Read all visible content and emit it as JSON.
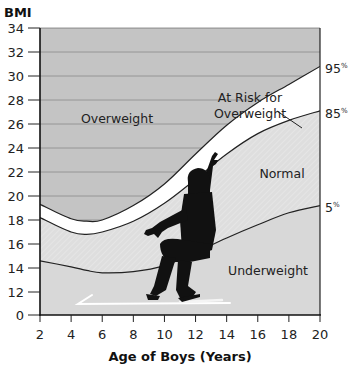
{
  "chart_data": {
    "type": "line",
    "title": "",
    "xlabel": "Age of Boys (Years)",
    "ylabel": "BMI",
    "xlim": [
      2,
      20
    ],
    "ylim": [
      0,
      34
    ],
    "y_axis_break": "axis jumps from 0 to 12",
    "x_ticks": [
      "2",
      "4",
      "6",
      "8",
      "10",
      "12",
      "14",
      "16",
      "18",
      "20"
    ],
    "y_ticks": [
      "0",
      "12",
      "14",
      "16",
      "18",
      "20",
      "22",
      "24",
      "26",
      "28",
      "30",
      "32",
      "34"
    ],
    "grid": "horizontal lines in overweight region",
    "x": [
      2,
      4,
      5,
      6,
      8,
      10,
      12,
      14,
      16,
      18,
      20
    ],
    "series": [
      {
        "name": "95%",
        "values": [
          19.3,
          18.1,
          17.9,
          18.0,
          19.2,
          21.0,
          23.5,
          25.9,
          27.8,
          29.3,
          30.8
        ]
      },
      {
        "name": "85%",
        "values": [
          18.2,
          17.0,
          16.8,
          17.0,
          17.9,
          19.4,
          21.4,
          23.5,
          25.2,
          26.3,
          27.1
        ]
      },
      {
        "name": "5%",
        "values": [
          14.6,
          14.1,
          13.8,
          13.6,
          13.7,
          14.2,
          15.3,
          16.5,
          17.6,
          18.6,
          19.2
        ]
      }
    ],
    "regions": [
      "Overweight",
      "At Risk for Overweight",
      "Normal",
      "Underweight"
    ],
    "annotations": [
      "95%",
      "85%",
      "5%"
    ]
  },
  "labels": {
    "y_title": "BMI",
    "x_title": "Age of Boys (Years)",
    "overweight": "Overweight",
    "at_risk_line1": "At Risk for",
    "at_risk_line2": "Overweight",
    "normal": "Normal",
    "underweight": "Underweight",
    "p95": "95",
    "p85": "85",
    "p5": "5",
    "pct": "%"
  },
  "colors": {
    "overweight_fill": "#c4c4c4",
    "normal_fill": "#dcdcdc",
    "underweight_fill": "#d6d6d6",
    "risk_band": "#ffffff",
    "line": "#222222",
    "gridline": "#8a8a8a"
  }
}
